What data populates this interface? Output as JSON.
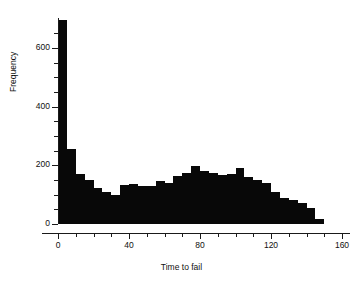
{
  "chart_data": {
    "type": "bar",
    "title": "",
    "subtitle": "",
    "xlabel": "Time to fail",
    "ylabel": "Frequency",
    "xlim": [
      0,
      160
    ],
    "ylim": [
      0,
      695
    ],
    "grid": false,
    "legend": null,
    "annotations": [],
    "bin_width": 5,
    "x_ticks": [
      0,
      40,
      80,
      120,
      160
    ],
    "x_tick_labels": [
      "0",
      "40",
      "80",
      "120",
      "160"
    ],
    "x_minor_tick_step": 10,
    "y_ticks": [
      0,
      200,
      400,
      600
    ],
    "y_tick_labels": [
      "0",
      "200",
      "400",
      "600"
    ],
    "y_minor_tick_step": 50,
    "bar_color": "#080808",
    "axis_color": "#1a1a1a",
    "background_color": "#ffffff",
    "categories": [
      "0-5",
      "5-10",
      "10-15",
      "15-20",
      "20-25",
      "25-30",
      "30-35",
      "35-40",
      "40-45",
      "45-50",
      "50-55",
      "55-60",
      "60-65",
      "65-70",
      "70-75",
      "75-80",
      "80-85",
      "85-90",
      "90-95",
      "95-100",
      "100-105",
      "105-110",
      "110-115",
      "115-120",
      "120-125",
      "125-130",
      "130-135",
      "135-140",
      "140-145",
      "145-150"
    ],
    "x": [
      0,
      5,
      10,
      15,
      20,
      25,
      30,
      35,
      40,
      45,
      50,
      55,
      60,
      65,
      70,
      75,
      80,
      85,
      90,
      95,
      100,
      105,
      110,
      115,
      120,
      125,
      130,
      135,
      140,
      145
    ],
    "values": [
      695,
      256,
      170,
      150,
      122,
      108,
      100,
      132,
      137,
      128,
      128,
      145,
      140,
      163,
      175,
      197,
      182,
      175,
      167,
      172,
      190,
      160,
      150,
      140,
      110,
      90,
      82,
      72,
      55,
      18
    ]
  }
}
